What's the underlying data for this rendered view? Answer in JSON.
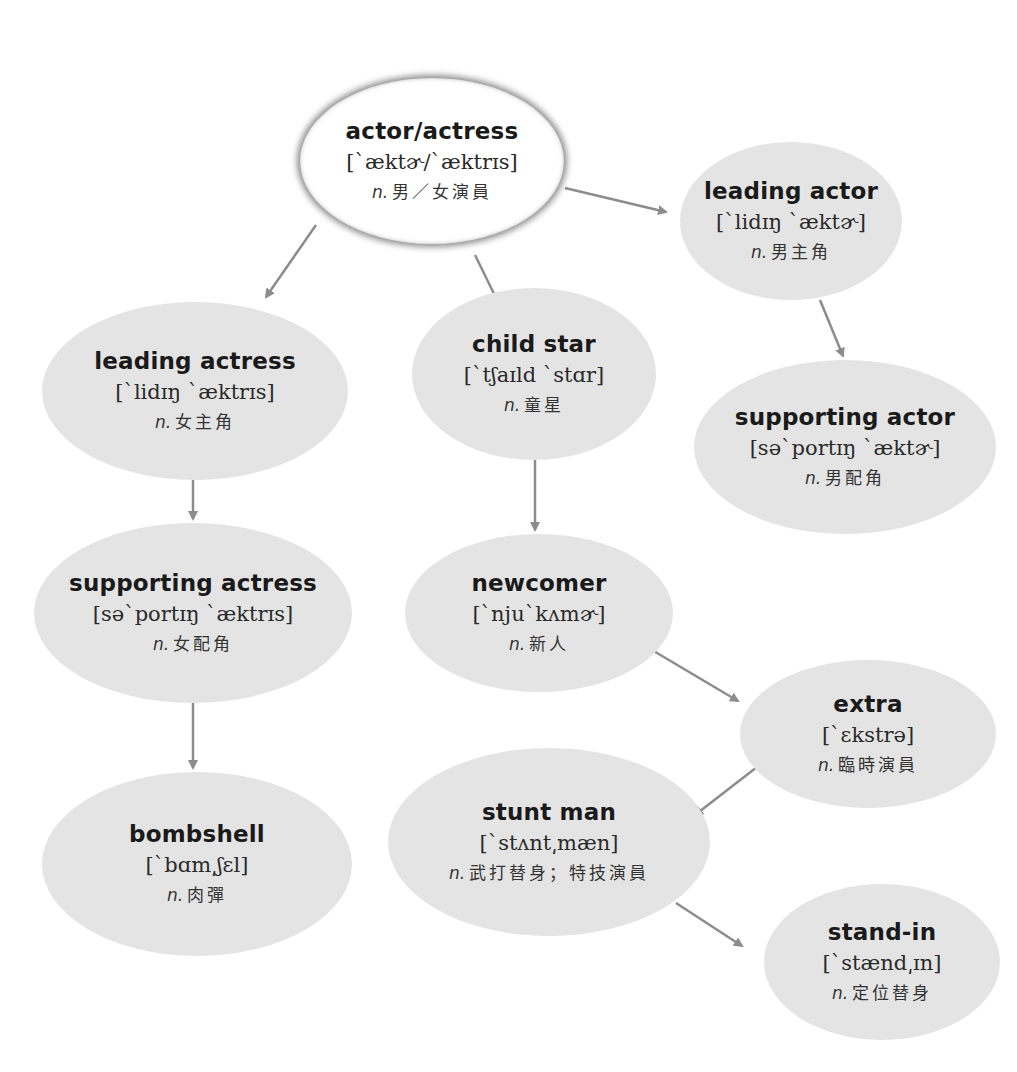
{
  "diagram": {
    "type": "vocabulary-mind-map",
    "colors": {
      "node_fill": "#e4e4e4",
      "root_fill": "#ffffff",
      "edge": "#8c8c8c",
      "text": "#1a1a1a"
    },
    "nodes": {
      "actor_actress": {
        "term": "actor/actress",
        "ipa": "[`æktɚ/`æktrɪs]",
        "pos": "n.",
        "meaning": "男／女演員"
      },
      "leading_actor": {
        "term": "leading actor",
        "ipa": "[`lidɪŋ `æktɚ]",
        "pos": "n.",
        "meaning": "男主角"
      },
      "leading_actress": {
        "term": "leading actress",
        "ipa": "[`lidɪŋ `æktrɪs]",
        "pos": "n.",
        "meaning": "女主角"
      },
      "child_star": {
        "term": "child star",
        "ipa": "[`tʃaɪld `stɑr]",
        "pos": "n.",
        "meaning": "童星"
      },
      "supporting_actor": {
        "term": "supporting actor",
        "ipa": "[sə`portɪŋ `æktɚ]",
        "pos": "n.",
        "meaning": "男配角"
      },
      "supporting_actress": {
        "term": "supporting actress",
        "ipa": "[sə`portɪŋ `æktrɪs]",
        "pos": "n.",
        "meaning": "女配角"
      },
      "newcomer": {
        "term": "newcomer",
        "ipa": "[`nju`kʌmɚ]",
        "pos": "n.",
        "meaning": "新人"
      },
      "extra": {
        "term": "extra",
        "ipa": "[`ɛkstrə]",
        "pos": "n.",
        "meaning": "臨時演員"
      },
      "bombshell": {
        "term": "bombshell",
        "ipa": "[`bɑm͵ʃɛl]",
        "pos": "n.",
        "meaning": "肉彈"
      },
      "stunt_man": {
        "term": "stunt man",
        "ipa": "[`stʌnt͵mæn]",
        "pos": "n.",
        "meaning": "武打替身；特技演員"
      },
      "stand_in": {
        "term": "stand-in",
        "ipa": "[`stænd͵ɪn]",
        "pos": "n.",
        "meaning": "定位替身"
      }
    },
    "edges": [
      {
        "from": "actor_actress",
        "to": "leading_actor"
      },
      {
        "from": "actor_actress",
        "to": "leading_actress"
      },
      {
        "from": "actor_actress",
        "to": "child_star"
      },
      {
        "from": "leading_actor",
        "to": "supporting_actor"
      },
      {
        "from": "leading_actress",
        "to": "supporting_actress"
      },
      {
        "from": "supporting_actress",
        "to": "bombshell"
      },
      {
        "from": "child_star",
        "to": "newcomer"
      },
      {
        "from": "newcomer",
        "to": "extra"
      },
      {
        "from": "extra",
        "to": "stunt_man"
      },
      {
        "from": "stunt_man",
        "to": "stand_in"
      }
    ]
  }
}
